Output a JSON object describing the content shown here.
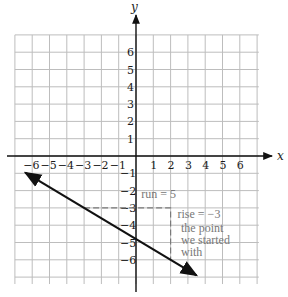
{
  "chart_data": {
    "type": "line",
    "title": "",
    "xlabel": "x",
    "ylabel": "y",
    "xlim": [
      -7,
      7
    ],
    "ylim": [
      -7,
      7
    ],
    "grid": true,
    "x_ticks": [
      "-6",
      "-5",
      "-4",
      "-3",
      "-2",
      "-1",
      "1",
      "2",
      "3",
      "4",
      "5",
      "6"
    ],
    "y_ticks": [
      "6",
      "5",
      "4",
      "3",
      "2",
      "1",
      "-1",
      "-2",
      "-3",
      "-4",
      "-5",
      "-6"
    ],
    "series": [
      {
        "name": "line",
        "slope": -0.6,
        "intercept": -4.8,
        "x": [
          -6.4,
          3.5
        ],
        "y": [
          -0.96,
          -6.9
        ],
        "arrows": "both"
      }
    ],
    "slope_triangle": {
      "start_point": [
        -3,
        -3
      ],
      "corner": [
        2,
        -3
      ],
      "end_point": [
        2,
        -6
      ],
      "style": "dashed"
    },
    "annotations": [
      {
        "text": "run = 5",
        "at": [
          0.3,
          -2.4
        ]
      },
      {
        "text": "rise = −3",
        "at": [
          2.4,
          -3.6
        ]
      },
      {
        "text": "the point",
        "at": [
          2.6,
          -4.4
        ]
      },
      {
        "text": "we started",
        "at": [
          2.6,
          -5.1
        ]
      },
      {
        "text": "with",
        "at": [
          2.6,
          -5.8
        ]
      }
    ],
    "colors": {
      "axis": "#111111",
      "grid": "#bdbdbd",
      "line": "#111111",
      "annotation": "#7a7a7a"
    }
  }
}
